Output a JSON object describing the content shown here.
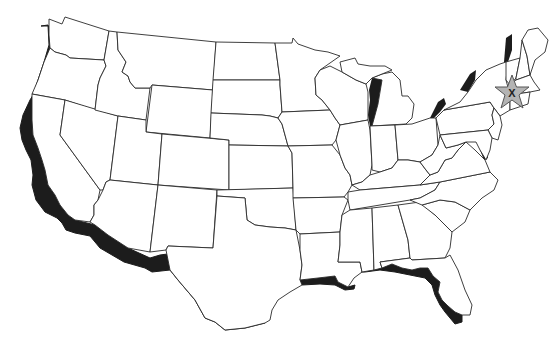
{
  "map": {
    "type": "outline-map",
    "region": "Contiguous United States",
    "coastline_style": "thick black shadow along Pacific coast, Gulf coast, Great Lakes and New England",
    "marker": {
      "shape": "star",
      "label": "X",
      "fill": "#b4b4b4",
      "stroke": "#555555",
      "location_description": "Southern New England (Massachusetts/Connecticut area)"
    },
    "colors": {
      "background": "#ffffff",
      "state_fill": "#ffffff",
      "border": "#2a2a2a",
      "coast_shadow": "#1c1c1c"
    }
  }
}
